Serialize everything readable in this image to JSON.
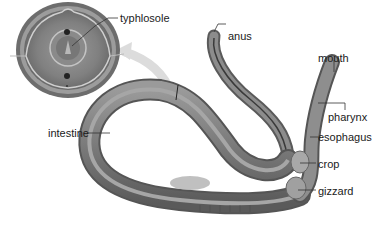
{
  "diagram": {
    "inset": {
      "description": "cross-section of earthworm body",
      "label": "typhlosole"
    },
    "labels": {
      "typhlosole": "typhlosole",
      "anus": "anus",
      "mouth": "mouth",
      "pharynx": "pharynx",
      "esophagus": "esophagus",
      "crop": "crop",
      "gizzard": "gizzard",
      "intestine": "intestine"
    },
    "colors": {
      "body_dark": "#5e5e5e",
      "body_mid": "#8a8a8a",
      "body_light": "#b5b5b5",
      "arrow": "#d8d8d8",
      "leader_line": "#333333"
    }
  }
}
